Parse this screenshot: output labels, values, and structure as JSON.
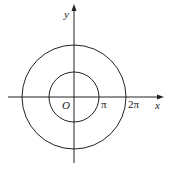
{
  "diagram": {
    "type": "polar-circles",
    "origin_label": "O",
    "x_axis_label": "x",
    "y_axis_label": "y",
    "tick_labels": [
      "π",
      "2π"
    ],
    "circles": [
      {
        "name": "inner",
        "radius_label": "π"
      },
      {
        "name": "outer",
        "radius_label": "2π"
      }
    ],
    "stroke_color": "#222222"
  }
}
